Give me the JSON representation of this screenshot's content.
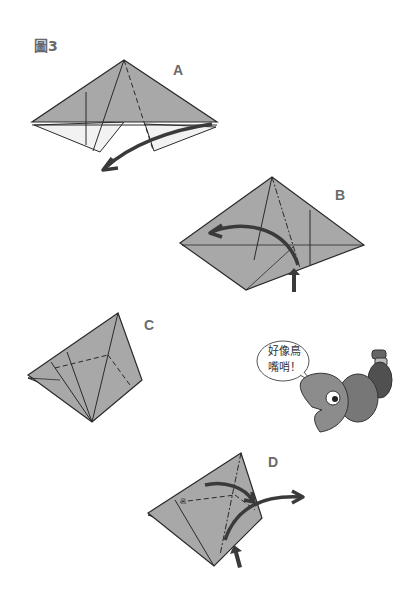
{
  "figure": {
    "title": "圖3"
  },
  "steps": [
    {
      "label": "A"
    },
    {
      "label": "B"
    },
    {
      "label": "C"
    },
    {
      "label": "D",
      "sub_label": "a"
    }
  ],
  "character": {
    "speech_line1": "好像鳥",
    "speech_line2": "嘴哨！"
  },
  "colors": {
    "paper_gray": "#a8a8a8",
    "paper_white": "#f2f2f2",
    "line": "#2a2a2a",
    "arrow": "#3a3a3a",
    "label": "#6a6a6a"
  }
}
